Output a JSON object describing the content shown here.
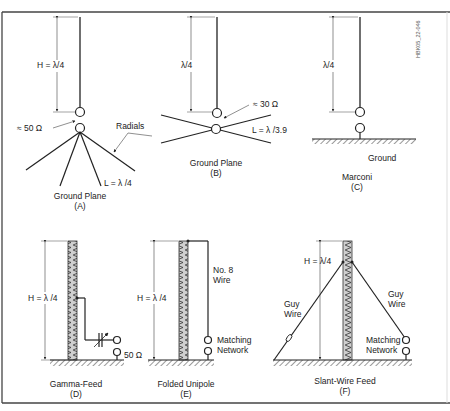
{
  "figure_id": "HBK05_22-046",
  "colors": {
    "line": "#222222",
    "frame": "#444444",
    "tower_fill": "#c8c8c8",
    "background": "#ffffff"
  },
  "panels": [
    {
      "id": "A",
      "title": "Ground Plane",
      "letter": "(A)",
      "labels": {
        "height": "H = λ/4",
        "impedance": "≈ 50 Ω",
        "radials": "Radials",
        "length": "L = λ /4"
      }
    },
    {
      "id": "B",
      "title": "Ground Plane",
      "letter": "(B)",
      "labels": {
        "height": "λ/4",
        "impedance": "≈ 30 Ω",
        "length": "L = λ /3.9"
      }
    },
    {
      "id": "C",
      "title": "Marconi",
      "letter": "(C)",
      "labels": {
        "height": "λ/4",
        "ground": "Ground"
      }
    },
    {
      "id": "D",
      "title": "Gamma-Feed",
      "letter": "(D)",
      "labels": {
        "height": "H = λ /4",
        "impedance": "50 Ω"
      }
    },
    {
      "id": "E",
      "title": "Folded Unipole",
      "letter": "(E)",
      "labels": {
        "height": "H = λ /4",
        "wire_line1": "No. 8",
        "wire_line2": "Wire",
        "network_line1": "Matching",
        "network_line2": "Network"
      }
    },
    {
      "id": "F",
      "title": "Slant-Wire Feed",
      "letter": "(F)",
      "labels": {
        "height": "H = λ/4",
        "guy_left_line1": "Guy",
        "guy_left_line2": "Wire",
        "guy_right_line1": "Guy",
        "guy_right_line2": "Wire",
        "network_line1": "Matching",
        "network_line2": "Network"
      }
    }
  ]
}
